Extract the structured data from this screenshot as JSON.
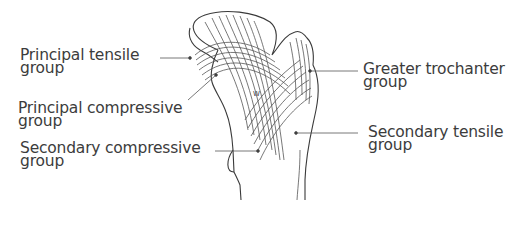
{
  "diagram": {
    "marker": "W",
    "labels": {
      "principal_tensile": {
        "line1": "Principal tensile",
        "line2": "group"
      },
      "principal_compressive": {
        "line1": "Principal compressive",
        "line2": "group"
      },
      "secondary_compressive": {
        "line1": "Secondary compressive",
        "line2": "group"
      },
      "greater_trochanter": {
        "line1": "Greater trochanter",
        "line2": "group"
      },
      "secondary_tensile": {
        "line1": "Secondary tensile",
        "line2": "group"
      }
    }
  }
}
